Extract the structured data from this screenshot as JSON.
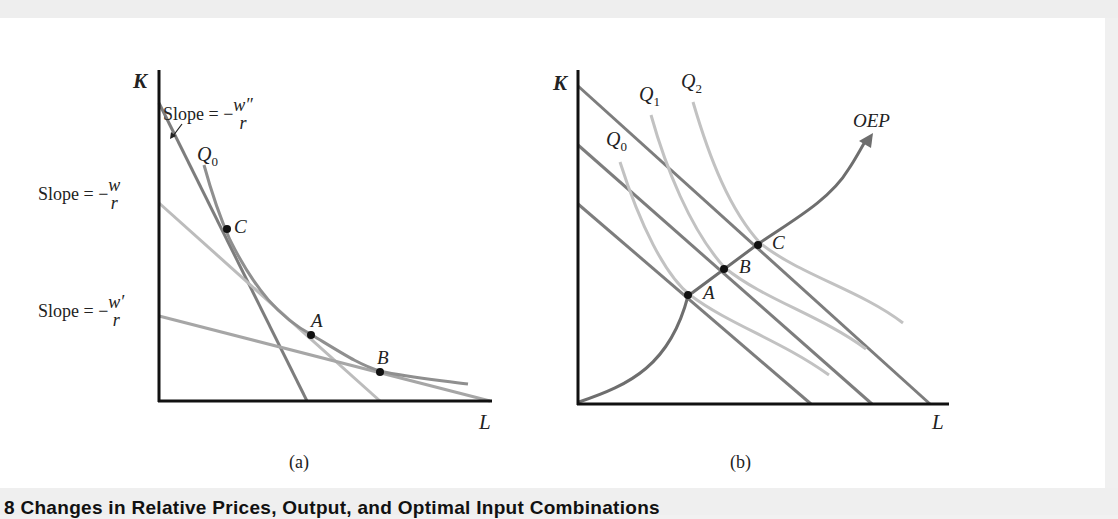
{
  "figure": {
    "caption": "8  Changes in Relative Prices, Output, and Optimal Input Combinations",
    "panels": [
      {
        "id": "a",
        "label": "(a)",
        "y_axis_label": "K",
        "x_axis_label": "L",
        "isoquant_label": "Q",
        "isoquant_sub": "0",
        "slope_labels": [
          {
            "prefix": "Slope = −",
            "num": "w″",
            "den": "r"
          },
          {
            "prefix": "Slope = −",
            "num": "w",
            "den": "r"
          },
          {
            "prefix": "Slope = −",
            "num": "w′",
            "den": "r"
          }
        ],
        "points": [
          "C",
          "A",
          "B"
        ]
      },
      {
        "id": "b",
        "label": "(b)",
        "y_axis_label": "K",
        "x_axis_label": "L",
        "isoquants": [
          {
            "label": "Q",
            "sub": "0"
          },
          {
            "label": "Q",
            "sub": "1"
          },
          {
            "label": "Q",
            "sub": "2"
          }
        ],
        "path_label": "OEP",
        "points": [
          "A",
          "B",
          "C"
        ]
      }
    ]
  },
  "colors": {
    "axis": "#111111",
    "isocost_dark": "#7a7a7a",
    "isocost_light": "#b8b8b8",
    "isoquant": "#9a9a9a",
    "isoquant_light": "#c4c4c4",
    "point": "#111111",
    "background": "#ffffff"
  }
}
